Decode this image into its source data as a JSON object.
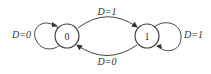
{
  "diagram": {
    "type": "state-machine",
    "colors": {
      "stroke": "#444444",
      "text": "#333333",
      "background": "#ffffff"
    },
    "states": [
      {
        "id": "s0",
        "label": "0"
      },
      {
        "id": "s1",
        "label": "1"
      }
    ],
    "transitions": [
      {
        "from": "0",
        "to": "1",
        "label": "D=1",
        "position": "top-arc"
      },
      {
        "from": "1",
        "to": "0",
        "label": "D=0",
        "position": "bottom-arc"
      },
      {
        "from": "0",
        "to": "0",
        "label": "D=0",
        "position": "left-self-loop"
      },
      {
        "from": "1",
        "to": "1",
        "label": "D=1",
        "position": "right-self-loop"
      }
    ]
  }
}
